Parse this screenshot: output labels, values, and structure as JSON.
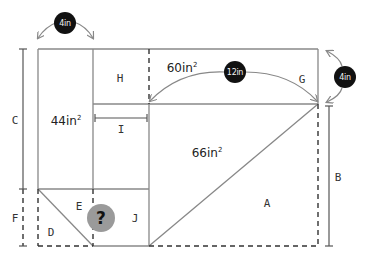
{
  "diagram": {
    "colors": {
      "line": "#888888",
      "dim_line": "#555555",
      "badge_bg": "#111111",
      "badge_text": "#f2f2f2",
      "question_bg": "#9a9a9a"
    },
    "region_labels": {
      "A": "A",
      "B": "B",
      "C": "C",
      "D": "D",
      "E": "E",
      "F": "F",
      "G": "G",
      "H": "H",
      "I": "I",
      "J": "J"
    },
    "areas": {
      "left_rect": {
        "value": "44in",
        "unit_sup": "2"
      },
      "top_right_rect": {
        "value": "60in",
        "unit_sup": "2"
      },
      "triangle": {
        "value": "66in",
        "unit_sup": "2"
      }
    },
    "dimensions": {
      "top_left_width": "4in",
      "top_right_span": "12in",
      "right_height": "4in"
    },
    "unknown": {
      "symbol": "?"
    }
  }
}
